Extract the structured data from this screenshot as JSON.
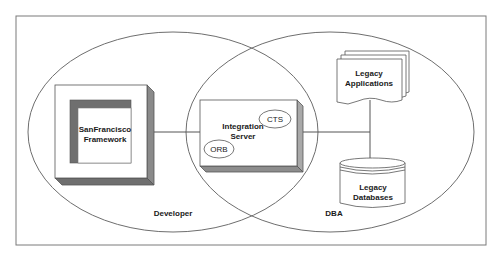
{
  "diagram": {
    "type": "venn-architecture",
    "colors": {
      "stroke": "#6e6e6e",
      "shade_dark": "#6f6f6f",
      "shade_light": "#a9a9a9",
      "background": "#ffffff",
      "text": "#1a1a1a"
    },
    "regions": {
      "left": {
        "label": "Developer"
      },
      "right": {
        "label": "DBA"
      }
    },
    "nodes": {
      "sanfrancisco": {
        "line1": "SanFrancisco",
        "line2": "Framework"
      },
      "integration": {
        "line1": "Integration",
        "line2": "Server"
      },
      "cts": {
        "label": "CTS"
      },
      "orb": {
        "label": "ORB"
      },
      "apps": {
        "line1": "Legacy",
        "line2": "Applications"
      },
      "databases": {
        "line1": "Legacy",
        "line2": "Databases"
      }
    },
    "edges": [
      {
        "from": "SanFrancisco Framework",
        "to": "Integration Server"
      },
      {
        "from": "Integration Server",
        "to": "Legacy Applications"
      },
      {
        "from": "Integration Server",
        "to": "Legacy Databases"
      }
    ]
  }
}
